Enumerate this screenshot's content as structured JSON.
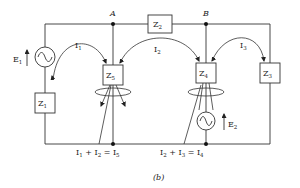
{
  "diagram": {
    "caption": "(b)",
    "nodes": [
      {
        "id": "A",
        "label": "A"
      },
      {
        "id": "B",
        "label": "B"
      }
    ],
    "impedances": [
      {
        "id": "Z1",
        "main": "Z",
        "sub": "1"
      },
      {
        "id": "Z2",
        "main": "Z",
        "sub": "2"
      },
      {
        "id": "Z3",
        "main": "Z",
        "sub": "3"
      },
      {
        "id": "Z4",
        "main": "Z",
        "sub": "4"
      },
      {
        "id": "Z5",
        "main": "Z",
        "sub": "5"
      }
    ],
    "sources": [
      {
        "id": "E1",
        "main": "E",
        "sub": "1"
      },
      {
        "id": "E2",
        "main": "E",
        "sub": "2"
      }
    ],
    "currents": [
      {
        "id": "I1",
        "main": "I",
        "sub": "1"
      },
      {
        "id": "I2",
        "main": "I",
        "sub": "2"
      },
      {
        "id": "I3",
        "main": "I",
        "sub": "3"
      }
    ],
    "equations": {
      "left": {
        "a": "I",
        "a_sub": "1",
        "op": " + ",
        "b": "I",
        "b_sub": "2",
        "eq": " = ",
        "c": "I",
        "c_sub": "5"
      },
      "right": {
        "a": "I",
        "a_sub": "2",
        "op": " + ",
        "b": "I",
        "b_sub": "3",
        "eq": " = ",
        "c": "I",
        "c_sub": "4"
      }
    }
  }
}
